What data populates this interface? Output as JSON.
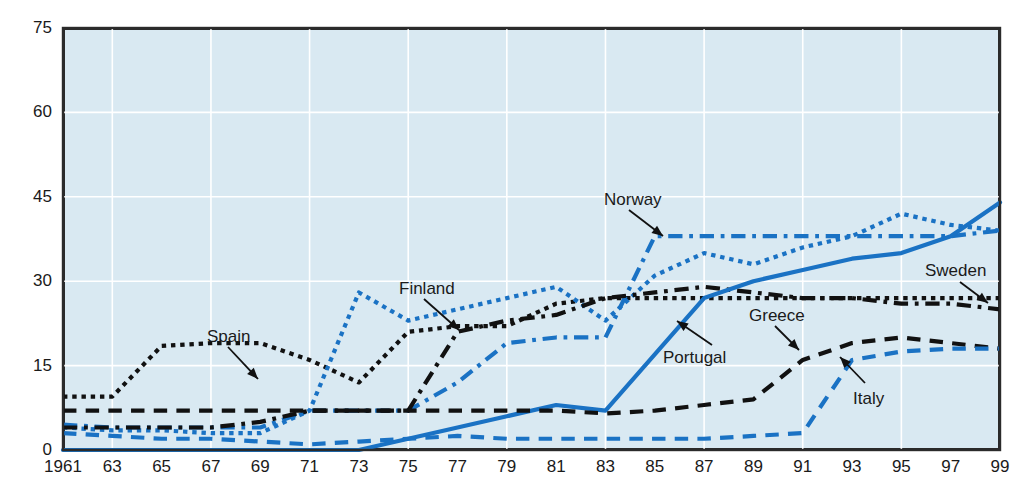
{
  "chart_data": {
    "type": "line",
    "title": "",
    "subtitle": "",
    "xlabel": "",
    "ylabel": "",
    "xlim": [
      1961,
      1999
    ],
    "ylim": [
      0,
      75
    ],
    "yticks": [
      0,
      15,
      30,
      45,
      60,
      75
    ],
    "xticks": [
      "1961",
      "63",
      "65",
      "67",
      "69",
      "71",
      "73",
      "75",
      "77",
      "79",
      "81",
      "83",
      "85",
      "87",
      "89",
      "91",
      "93",
      "95",
      "97",
      "99"
    ],
    "x": [
      1961,
      1963,
      1965,
      1967,
      1969,
      1971,
      1973,
      1975,
      1977,
      1979,
      1981,
      1983,
      1985,
      1987,
      1989,
      1991,
      1993,
      1995,
      1997,
      1999
    ],
    "grid": true,
    "grid_color": "#ffffff",
    "plot_background": "#d9e9f2",
    "legend_position": "inline-annotations",
    "series": [
      {
        "name": "Spain",
        "color": "#111111",
        "style": "dotted",
        "values": [
          9.5,
          9.5,
          18.5,
          19,
          19,
          16,
          12,
          21,
          22,
          22,
          26,
          27,
          27,
          27,
          27,
          27,
          27,
          27,
          27,
          27
        ]
      },
      {
        "name": "Finland",
        "color": "#1a72c4",
        "style": "dotted",
        "values": [
          4,
          3.5,
          3.5,
          3,
          3,
          7,
          28,
          23,
          25,
          27,
          29,
          23,
          31,
          35,
          33,
          36,
          38,
          42,
          40,
          39
        ]
      },
      {
        "name": "Norway",
        "color": "#1a72c4",
        "style": "dashdot",
        "values": [
          4.5,
          4,
          4,
          4,
          4,
          7,
          7,
          7,
          12,
          19,
          20,
          20,
          38,
          38,
          38,
          38,
          38,
          38,
          38,
          39
        ]
      },
      {
        "name": "Sweden",
        "color": "#111111",
        "style": "dashdot",
        "values": [
          4,
          4,
          4,
          4,
          5,
          7,
          7,
          7,
          21,
          23,
          24,
          27,
          28,
          29,
          28,
          27,
          27,
          26,
          26,
          25
        ]
      },
      {
        "name": "Portugal",
        "color": "#1a72c4",
        "style": "solid",
        "values": [
          0,
          0,
          0,
          0,
          0,
          0,
          0,
          2,
          4,
          6,
          8,
          7,
          17,
          27,
          30,
          32,
          34,
          35,
          38,
          44
        ]
      },
      {
        "name": "Greece",
        "color": "#111111",
        "style": "dashed",
        "values": [
          7,
          7,
          7,
          7,
          7,
          7,
          7,
          7,
          7,
          7,
          7,
          6.5,
          7,
          8,
          9,
          16,
          19,
          20,
          19,
          18
        ]
      },
      {
        "name": "Italy",
        "color": "#1a72c4",
        "style": "dashed",
        "values": [
          3,
          2.5,
          2,
          2,
          1.5,
          1,
          1.5,
          2,
          2.5,
          2,
          2,
          2,
          2,
          2,
          2.5,
          3,
          16,
          17.5,
          18,
          18
        ]
      }
    ],
    "annotations": [
      {
        "label": "Spain",
        "label_x": 207,
        "label_y": 328,
        "arrow_from_x": 228,
        "arrow_from_y": 347,
        "arrow_to_x": 258,
        "arrow_to_y": 379
      },
      {
        "label": "Finland",
        "label_x": 399,
        "label_y": 280,
        "arrow_from_x": 424,
        "arrow_from_y": 299,
        "arrow_to_x": 459,
        "arrow_to_y": 330
      },
      {
        "label": "Norway",
        "label_x": 604,
        "label_y": 191,
        "arrow_from_x": 629,
        "arrow_from_y": 210,
        "arrow_to_x": 663,
        "arrow_to_y": 236
      },
      {
        "label": "Portugal",
        "label_x": 663,
        "label_y": 349,
        "arrow_from_x": 712,
        "arrow_from_y": 345,
        "arrow_to_x": 677,
        "arrow_to_y": 321
      },
      {
        "label": "Greece",
        "label_x": 749,
        "label_y": 307,
        "arrow_from_x": 775,
        "arrow_from_y": 326,
        "arrow_to_x": 799,
        "arrow_to_y": 350
      },
      {
        "label": "Italy",
        "label_x": 853,
        "label_y": 390,
        "arrow_from_x": 865,
        "arrow_from_y": 383,
        "arrow_to_x": 840,
        "arrow_to_y": 357
      },
      {
        "label": "Sweden",
        "label_x": 925,
        "label_y": 262,
        "arrow_from_x": 960,
        "arrow_from_y": 282,
        "arrow_to_x": 988,
        "arrow_to_y": 303
      }
    ]
  }
}
